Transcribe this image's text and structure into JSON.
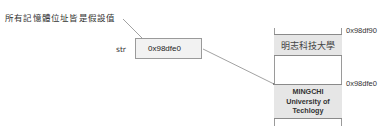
{
  "note": "所有記憶體位址皆是假設值",
  "variable": {
    "name": "str",
    "value": "0x98dfe0"
  },
  "memory": {
    "cells": [
      {
        "address": "0x98df90",
        "content_lines": [
          "明志科技大學"
        ]
      },
      {
        "address": "0x98dfe0",
        "content_lines": [
          "MINGCHI",
          "University of",
          "Techlogy"
        ]
      }
    ]
  },
  "colors": {
    "line": "#8a8a8a",
    "cell_fill": "#e6e6e6",
    "var_fill": "#f2f2f2"
  }
}
